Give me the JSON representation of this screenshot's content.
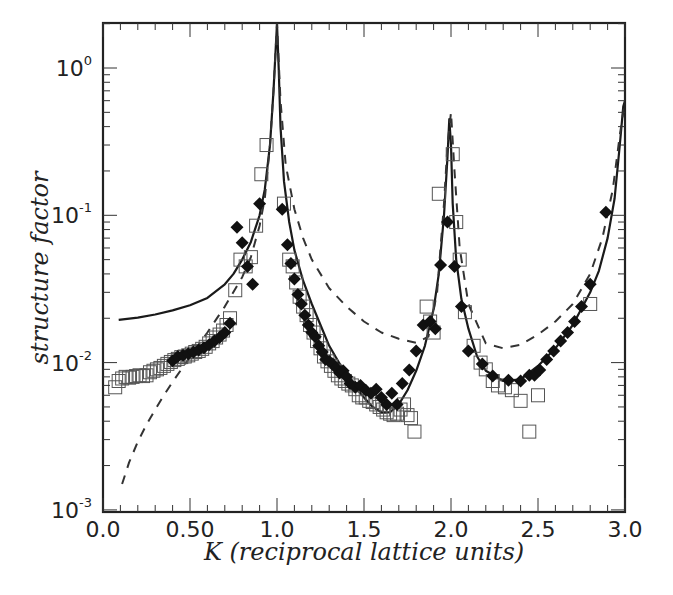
{
  "chart_data": {
    "type": "scatter",
    "title": "",
    "xlabel": "K (reciprocal lattice units)",
    "ylabel": "structure factor",
    "xlim": [
      0.0,
      3.0
    ],
    "ylim": [
      0.001,
      2.0
    ],
    "yscale": "log",
    "grid": false,
    "legend": null,
    "x_ticks": [
      "0.0",
      "0.50",
      "1.0",
      "1.5",
      "2.0",
      "2.5",
      "3.0"
    ],
    "x_tick_values": [
      0.0,
      0.5,
      1.0,
      1.5,
      2.0,
      2.5,
      3.0
    ],
    "y_ticks": [
      {
        "base": "10",
        "exp": "0",
        "value": 1
      },
      {
        "base": "10",
        "exp": "-1",
        "value": 0.1
      },
      {
        "base": "10",
        "exp": "-2",
        "value": 0.01
      },
      {
        "base": "10",
        "exp": "-3",
        "value": 0.001
      }
    ],
    "series": [
      {
        "name": "open squares",
        "style": "open-square",
        "color": "#555555",
        "x": [
          0.07,
          0.09,
          0.11,
          0.13,
          0.15,
          0.17,
          0.19,
          0.21,
          0.23,
          0.25,
          0.27,
          0.29,
          0.31,
          0.33,
          0.35,
          0.37,
          0.39,
          0.41,
          0.43,
          0.45,
          0.47,
          0.49,
          0.51,
          0.53,
          0.55,
          0.57,
          0.59,
          0.61,
          0.63,
          0.65,
          0.67,
          0.69,
          0.71,
          0.73,
          0.76,
          0.79,
          0.82,
          0.85,
          0.88,
          0.91,
          0.94,
          1.04,
          1.07,
          1.09,
          1.11,
          1.13,
          1.15,
          1.17,
          1.19,
          1.21,
          1.23,
          1.25,
          1.27,
          1.29,
          1.31,
          1.33,
          1.35,
          1.37,
          1.39,
          1.41,
          1.43,
          1.45,
          1.47,
          1.49,
          1.51,
          1.53,
          1.55,
          1.57,
          1.59,
          1.61,
          1.63,
          1.65,
          1.67,
          1.69,
          1.71,
          1.73,
          1.75,
          1.77,
          1.79,
          1.86,
          1.88,
          1.9,
          1.93,
          2.01,
          2.03,
          2.05,
          2.08,
          2.13,
          2.17,
          2.2,
          2.24,
          2.27,
          2.31,
          2.35,
          2.4,
          2.45,
          2.5,
          2.8
        ],
        "y": [
          0.0068,
          0.0075,
          0.0078,
          0.008,
          0.0079,
          0.008,
          0.0081,
          0.0082,
          0.0081,
          0.0082,
          0.0086,
          0.0088,
          0.009,
          0.0092,
          0.0095,
          0.0098,
          0.0101,
          0.0104,
          0.0106,
          0.0109,
          0.011,
          0.0112,
          0.0115,
          0.0118,
          0.012,
          0.0124,
          0.0128,
          0.0135,
          0.014,
          0.0148,
          0.0155,
          0.0165,
          0.018,
          0.02,
          0.031,
          0.05,
          0.045,
          0.052,
          0.085,
          0.19,
          0.3,
          0.12,
          0.05,
          0.045,
          0.035,
          0.028,
          0.024,
          0.021,
          0.018,
          0.016,
          0.014,
          0.0125,
          0.011,
          0.0102,
          0.0095,
          0.0088,
          0.0082,
          0.0078,
          0.0075,
          0.0072,
          0.007,
          0.0066,
          0.006,
          0.0058,
          0.0058,
          0.0055,
          0.0054,
          0.0052,
          0.005,
          0.0048,
          0.0046,
          0.0045,
          0.0044,
          0.0045,
          0.0048,
          0.0052,
          0.0044,
          0.0042,
          0.0034,
          0.024,
          0.019,
          0.016,
          0.14,
          0.26,
          0.09,
          0.05,
          0.022,
          0.013,
          0.01,
          0.009,
          0.0075,
          0.007,
          0.0068,
          0.0065,
          0.0055,
          0.0034,
          0.006,
          0.025
        ]
      },
      {
        "name": "filled diamonds",
        "style": "filled-diamond",
        "color": "#111111",
        "x": [
          0.4,
          0.43,
          0.46,
          0.49,
          0.52,
          0.55,
          0.58,
          0.61,
          0.64,
          0.67,
          0.7,
          0.73,
          0.77,
          0.8,
          0.83,
          0.86,
          0.9,
          1.03,
          1.06,
          1.08,
          1.1,
          1.12,
          1.14,
          1.16,
          1.18,
          1.2,
          1.22,
          1.24,
          1.26,
          1.28,
          1.3,
          1.32,
          1.34,
          1.36,
          1.38,
          1.4,
          1.42,
          1.45,
          1.48,
          1.51,
          1.54,
          1.57,
          1.6,
          1.63,
          1.66,
          1.69,
          1.72,
          1.76,
          1.8,
          1.84,
          1.88,
          1.91,
          1.94,
          1.98,
          2.02,
          2.06,
          2.1,
          2.18,
          2.24,
          2.33,
          2.4,
          2.45,
          2.48,
          2.51,
          2.55,
          2.59,
          2.63,
          2.67,
          2.71,
          2.75,
          2.8,
          2.89
        ],
        "y": [
          0.0103,
          0.011,
          0.0112,
          0.0115,
          0.0118,
          0.0122,
          0.0126,
          0.0132,
          0.014,
          0.0148,
          0.016,
          0.0185,
          0.083,
          0.065,
          0.045,
          0.034,
          0.12,
          0.11,
          0.063,
          0.047,
          0.037,
          0.029,
          0.025,
          0.021,
          0.018,
          0.016,
          0.015,
          0.013,
          0.0118,
          0.0105,
          0.0102,
          0.0098,
          0.0092,
          0.0085,
          0.0088,
          0.008,
          0.0072,
          0.0068,
          0.007,
          0.0065,
          0.0062,
          0.0066,
          0.0058,
          0.0052,
          0.0062,
          0.0052,
          0.0072,
          0.0089,
          0.012,
          0.018,
          0.019,
          0.017,
          0.046,
          0.09,
          0.045,
          0.024,
          0.012,
          0.0098,
          0.0081,
          0.0076,
          0.0075,
          0.0082,
          0.0082,
          0.0089,
          0.0105,
          0.012,
          0.014,
          0.016,
          0.019,
          0.024,
          0.034,
          0.105
        ]
      },
      {
        "name": "solid curve",
        "style": "line-solid",
        "color": "#1a1a1a",
        "x": [
          0.09,
          0.2,
          0.3,
          0.4,
          0.5,
          0.6,
          0.7,
          0.75,
          0.8,
          0.85,
          0.9,
          0.93,
          0.96,
          0.98,
          0.99,
          1.0,
          1.01,
          1.02,
          1.04,
          1.07,
          1.1,
          1.15,
          1.2,
          1.25,
          1.3,
          1.35,
          1.4,
          1.45,
          1.5,
          1.55,
          1.6,
          1.65,
          1.7,
          1.75,
          1.8,
          1.85,
          1.9,
          1.93,
          1.96,
          1.98,
          1.99,
          2.0,
          2.01,
          2.03,
          2.06,
          2.1,
          2.15,
          2.2,
          2.3,
          2.4,
          2.5,
          2.6,
          2.7,
          2.8,
          2.85,
          2.9,
          2.94,
          2.97,
          2.99,
          3.0
        ],
        "y": [
          0.0195,
          0.0202,
          0.0212,
          0.0226,
          0.0245,
          0.0275,
          0.034,
          0.04,
          0.05,
          0.066,
          0.1,
          0.15,
          0.3,
          0.7,
          1.2,
          2.0,
          1.0,
          0.4,
          0.17,
          0.09,
          0.058,
          0.036,
          0.025,
          0.018,
          0.013,
          0.0103,
          0.0082,
          0.0068,
          0.0058,
          0.005,
          0.0046,
          0.0046,
          0.0052,
          0.0065,
          0.0088,
          0.013,
          0.023,
          0.04,
          0.1,
          0.25,
          0.45,
          0.3,
          0.12,
          0.05,
          0.027,
          0.017,
          0.011,
          0.0088,
          0.0075,
          0.0077,
          0.0095,
          0.0125,
          0.018,
          0.03,
          0.042,
          0.07,
          0.13,
          0.3,
          0.55,
          0.6
        ]
      },
      {
        "name": "dashed curve",
        "style": "line-dashed",
        "color": "#333333",
        "x": [
          0.11,
          0.15,
          0.2,
          0.25,
          0.3,
          0.35,
          0.4,
          0.5,
          0.6,
          0.7,
          0.8,
          0.85,
          0.9,
          0.93,
          0.96,
          0.98,
          1.0,
          1.02,
          1.05,
          1.1,
          1.15,
          1.2,
          1.3,
          1.4,
          1.5,
          1.6,
          1.7,
          1.8,
          1.87,
          1.92,
          1.96,
          1.98,
          2.0,
          2.02,
          2.05,
          2.1,
          2.2,
          2.3,
          2.4,
          2.5,
          2.6,
          2.7,
          2.8,
          2.87,
          2.93,
          2.97,
          3.0
        ],
        "y": [
          0.0015,
          0.0021,
          0.0029,
          0.0038,
          0.0048,
          0.006,
          0.0074,
          0.0109,
          0.016,
          0.024,
          0.038,
          0.052,
          0.085,
          0.13,
          0.3,
          0.7,
          2.0,
          0.6,
          0.22,
          0.11,
          0.07,
          0.05,
          0.032,
          0.024,
          0.019,
          0.016,
          0.0145,
          0.0136,
          0.015,
          0.03,
          0.12,
          0.3,
          0.5,
          0.2,
          0.06,
          0.025,
          0.0135,
          0.0125,
          0.0132,
          0.0155,
          0.019,
          0.025,
          0.04,
          0.07,
          0.15,
          0.35,
          0.6
        ]
      }
    ]
  }
}
